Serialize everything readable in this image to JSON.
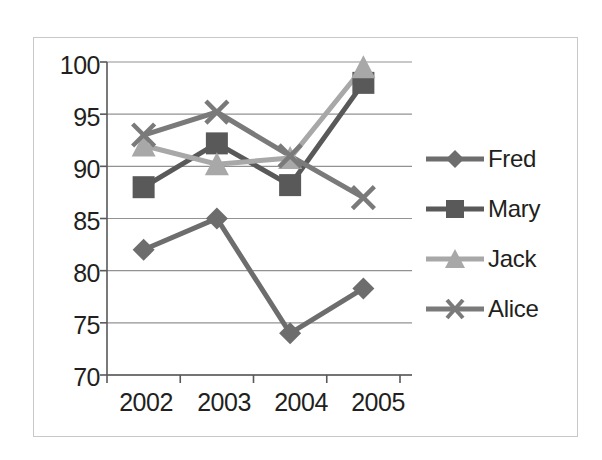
{
  "chart_data": {
    "type": "line",
    "title": "",
    "subtitle": "",
    "xlabel": "",
    "ylabel": "",
    "categories": [
      "2002",
      "2003",
      "2004",
      "2005"
    ],
    "ylim": [
      70,
      100
    ],
    "yticks": [
      70,
      75,
      80,
      85,
      90,
      95,
      100
    ],
    "ytick_labels": [
      "70",
      "75",
      "80",
      "85",
      "90",
      "95",
      "100"
    ],
    "grid": true,
    "legend_position": "right",
    "series": [
      {
        "name": "Fred",
        "marker": "diamond",
        "color": "#6d6d6d",
        "values": [
          82,
          85,
          74,
          78.3
        ]
      },
      {
        "name": "Mary",
        "marker": "square",
        "color": "#595959",
        "values": [
          88,
          92.2,
          88.2,
          98
        ]
      },
      {
        "name": "Jack",
        "marker": "triangle",
        "color": "#a8a8a8",
        "values": [
          92,
          90.2,
          90.8,
          99.5
        ]
      },
      {
        "name": "Alice",
        "marker": "x",
        "color": "#7a7a7a",
        "values": [
          93,
          95.2,
          91,
          87
        ]
      }
    ]
  },
  "axis": {
    "ytick_labels": [
      "100",
      "95",
      "90",
      "85",
      "80",
      "75",
      "70"
    ],
    "xtick_labels": [
      "2002",
      "2003",
      "2004",
      "2005"
    ]
  },
  "legend": {
    "items": [
      {
        "label": "Fred",
        "marker": "diamond-marker-icon"
      },
      {
        "label": "Mary",
        "marker": "square-marker-icon"
      },
      {
        "label": "Jack",
        "marker": "triangle-marker-icon"
      },
      {
        "label": "Alice",
        "marker": "x-marker-icon"
      }
    ]
  },
  "colors": {
    "frame_border": "#c8c8c8",
    "gridline": "#808080",
    "axis": "#595959",
    "text": "#231f20",
    "fred": "#6d6d6d",
    "mary": "#595959",
    "jack": "#a8a8a8",
    "alice": "#7a7a7a"
  }
}
